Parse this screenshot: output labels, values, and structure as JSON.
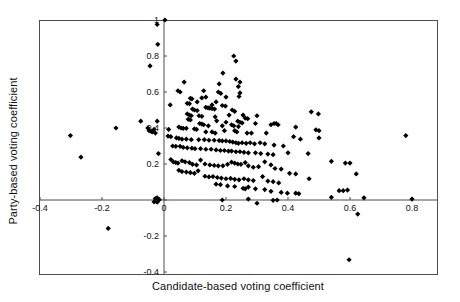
{
  "chart_data": {
    "type": "scatter",
    "title": "",
    "xlabel": "Candidate-based voting coefficient",
    "ylabel": "Party-based voting coefficient",
    "xlim": [
      -0.44,
      0.89
    ],
    "ylim": [
      -0.42,
      1.02
    ],
    "xticks": [
      -0.4,
      -0.2,
      0,
      0.2,
      0.4,
      0.6,
      0.8
    ],
    "xticklabels": [
      "-0.4",
      "-0.2",
      "0",
      "0.2",
      "0.4",
      "0.6",
      "0.8"
    ],
    "yticks": [
      -0.4,
      -0.2,
      0,
      0.2,
      0.4,
      0.6,
      0.8,
      1
    ],
    "yticklabels": [
      "-0.4",
      "-0.2",
      "0",
      "0.2",
      "0.4",
      "0.6",
      "0.8",
      "1"
    ],
    "grid": false,
    "legend": null,
    "marker": "diamond",
    "marker_color": "#000000",
    "marker_size": 4,
    "axis_lines": {
      "x_at_y": 0,
      "y_at_x": 0
    },
    "frame_color": "#4d4d4d",
    "points": [
      [
        0.003,
        1.0
      ],
      [
        -0.022,
        0.975
      ],
      [
        -0.02,
        0.865
      ],
      [
        -0.045,
        0.745
      ],
      [
        0.225,
        0.8
      ],
      [
        0.232,
        0.772
      ],
      [
        0.19,
        0.705
      ],
      [
        0.232,
        0.672
      ],
      [
        0.245,
        0.655
      ],
      [
        0.065,
        0.655
      ],
      [
        0.178,
        0.645
      ],
      [
        0.24,
        0.63
      ],
      [
        0.045,
        0.607
      ],
      [
        0.052,
        0.6
      ],
      [
        0.128,
        0.607
      ],
      [
        0.175,
        0.6
      ],
      [
        0.183,
        0.592
      ],
      [
        0.245,
        0.595
      ],
      [
        0.242,
        0.575
      ],
      [
        0.2,
        0.572
      ],
      [
        0.135,
        0.572
      ],
      [
        0.122,
        0.567
      ],
      [
        0.085,
        0.565
      ],
      [
        0.09,
        0.562
      ],
      [
        0.107,
        0.545
      ],
      [
        0.168,
        0.545
      ],
      [
        0.075,
        0.537
      ],
      [
        0.082,
        0.535
      ],
      [
        0.02,
        0.528
      ],
      [
        0.155,
        0.528
      ],
      [
        0.188,
        0.525
      ],
      [
        0.198,
        0.522
      ],
      [
        0.135,
        0.515
      ],
      [
        0.142,
        0.512
      ],
      [
        0.148,
        0.51
      ],
      [
        0.155,
        0.508
      ],
      [
        0.163,
        0.505
      ],
      [
        0.092,
        0.505
      ],
      [
        0.098,
        0.5
      ],
      [
        0.107,
        0.497
      ],
      [
        0.22,
        0.5
      ],
      [
        0.228,
        0.492
      ],
      [
        0.075,
        0.478
      ],
      [
        0.082,
        0.472
      ],
      [
        0.088,
        0.468
      ],
      [
        0.113,
        0.468
      ],
      [
        0.122,
        0.465
      ],
      [
        0.21,
        0.472
      ],
      [
        0.165,
        0.462
      ],
      [
        0.255,
        0.472
      ],
      [
        0.262,
        0.455
      ],
      [
        0.27,
        0.452
      ],
      [
        0.3,
        0.468
      ],
      [
        0.498,
        0.478
      ],
      [
        0.475,
        0.49
      ],
      [
        0.078,
        0.448
      ],
      [
        0.085,
        0.445
      ],
      [
        0.17,
        0.44
      ],
      [
        0.2,
        0.432
      ],
      [
        0.238,
        0.438
      ],
      [
        0.245,
        0.432
      ],
      [
        0.252,
        0.428
      ],
      [
        0.295,
        0.425
      ],
      [
        0.115,
        0.425
      ],
      [
        0.122,
        0.422
      ],
      [
        0.128,
        0.418
      ],
      [
        0.143,
        0.412
      ],
      [
        0.188,
        0.412
      ],
      [
        0.218,
        0.418
      ],
      [
        0.225,
        0.412
      ],
      [
        0.24,
        0.408
      ],
      [
        0.345,
        0.418
      ],
      [
        0.355,
        0.425
      ],
      [
        0.362,
        0.425
      ],
      [
        0.368,
        0.418
      ],
      [
        0.425,
        0.405
      ],
      [
        0.49,
        0.39
      ],
      [
        0.5,
        0.345
      ],
      [
        0.5,
        0.385
      ],
      [
        0.048,
        0.405
      ],
      [
        0.055,
        0.4
      ],
      [
        0.062,
        0.398
      ],
      [
        0.072,
        0.398
      ],
      [
        0.098,
        0.395
      ],
      [
        0.105,
        0.392
      ],
      [
        0.015,
        0.392
      ],
      [
        0.135,
        0.378
      ],
      [
        0.155,
        0.378
      ],
      [
        0.165,
        0.372
      ],
      [
        0.195,
        0.385
      ],
      [
        0.228,
        0.385
      ],
      [
        0.235,
        0.378
      ],
      [
        0.268,
        0.372
      ],
      [
        0.282,
        0.372
      ],
      [
        0.33,
        0.372
      ],
      [
        0.418,
        0.352
      ],
      [
        0.44,
        0.338
      ],
      [
        0.013,
        0.355
      ],
      [
        0.022,
        0.352
      ],
      [
        0.04,
        0.345
      ],
      [
        0.048,
        0.342
      ],
      [
        0.058,
        0.338
      ],
      [
        0.072,
        0.338
      ],
      [
        0.088,
        0.335
      ],
      [
        0.112,
        0.335
      ],
      [
        0.13,
        0.335
      ],
      [
        0.145,
        0.332
      ],
      [
        0.162,
        0.332
      ],
      [
        0.178,
        0.33
      ],
      [
        0.188,
        0.328
      ],
      [
        0.2,
        0.328
      ],
      [
        0.212,
        0.325
      ],
      [
        0.222,
        0.322
      ],
      [
        0.232,
        0.318
      ],
      [
        0.24,
        0.315
      ],
      [
        0.252,
        0.318
      ],
      [
        0.265,
        0.315
      ],
      [
        0.278,
        0.318
      ],
      [
        0.292,
        0.312
      ],
      [
        0.31,
        0.318
      ],
      [
        0.325,
        0.312
      ],
      [
        0.355,
        0.305
      ],
      [
        0.385,
        0.3
      ],
      [
        0.78,
        0.358
      ],
      [
        -0.302,
        0.358
      ],
      [
        -0.268,
        0.238
      ],
      [
        -0.155,
        0.4
      ],
      [
        -0.075,
        0.438
      ],
      [
        -0.052,
        0.4
      ],
      [
        -0.048,
        0.385
      ],
      [
        -0.042,
        0.382
      ],
      [
        -0.038,
        0.378
      ],
      [
        -0.032,
        0.392
      ],
      [
        -0.028,
        0.372
      ],
      [
        -0.022,
        0.438
      ],
      [
        -0.018,
        0.258
      ],
      [
        0.028,
        0.3
      ],
      [
        0.038,
        0.298
      ],
      [
        0.052,
        0.298
      ],
      [
        0.062,
        0.292
      ],
      [
        0.075,
        0.29
      ],
      [
        0.09,
        0.288
      ],
      [
        0.1,
        0.285
      ],
      [
        0.118,
        0.285
      ],
      [
        0.135,
        0.282
      ],
      [
        0.152,
        0.282
      ],
      [
        0.168,
        0.278
      ],
      [
        0.182,
        0.275
      ],
      [
        0.195,
        0.275
      ],
      [
        0.208,
        0.272
      ],
      [
        0.218,
        0.272
      ],
      [
        0.232,
        0.268
      ],
      [
        0.245,
        0.268
      ],
      [
        0.258,
        0.265
      ],
      [
        0.272,
        0.262
      ],
      [
        0.295,
        0.262
      ],
      [
        0.312,
        0.258
      ],
      [
        0.335,
        0.255
      ],
      [
        0.352,
        0.252
      ],
      [
        0.4,
        0.262
      ],
      [
        0.465,
        0.258
      ],
      [
        0.54,
        0.215
      ],
      [
        0.585,
        0.205
      ],
      [
        0.6,
        0.205
      ],
      [
        0.022,
        0.225
      ],
      [
        0.03,
        0.212
      ],
      [
        0.038,
        0.208
      ],
      [
        0.045,
        0.205
      ],
      [
        0.058,
        0.218
      ],
      [
        0.068,
        0.212
      ],
      [
        0.082,
        0.208
      ],
      [
        0.092,
        0.198
      ],
      [
        0.105,
        0.195
      ],
      [
        0.118,
        0.222
      ],
      [
        0.132,
        0.2
      ],
      [
        0.148,
        0.195
      ],
      [
        0.162,
        0.192
      ],
      [
        0.175,
        0.19
      ],
      [
        0.19,
        0.19
      ],
      [
        0.205,
        0.198
      ],
      [
        0.218,
        0.21
      ],
      [
        0.228,
        0.205
      ],
      [
        0.238,
        0.2
      ],
      [
        0.248,
        0.198
      ],
      [
        0.262,
        0.208
      ],
      [
        0.272,
        0.19
      ],
      [
        0.288,
        0.182
      ],
      [
        0.305,
        0.185
      ],
      [
        0.325,
        0.212
      ],
      [
        0.345,
        0.195
      ],
      [
        0.358,
        0.175
      ],
      [
        0.378,
        0.172
      ],
      [
        0.405,
        0.148
      ],
      [
        0.425,
        0.145
      ],
      [
        0.62,
        0.145
      ],
      [
        0.468,
        0.118
      ],
      [
        0.048,
        0.165
      ],
      [
        0.058,
        0.158
      ],
      [
        0.072,
        0.155
      ],
      [
        0.085,
        0.152
      ],
      [
        0.098,
        0.148
      ],
      [
        0.11,
        0.162
      ],
      [
        0.132,
        0.132
      ],
      [
        0.145,
        0.128
      ],
      [
        0.158,
        0.13
      ],
      [
        0.172,
        0.125
      ],
      [
        0.185,
        0.122
      ],
      [
        0.2,
        0.118
      ],
      [
        0.215,
        0.12
      ],
      [
        0.228,
        0.115
      ],
      [
        0.242,
        0.112
      ],
      [
        0.258,
        0.118
      ],
      [
        0.272,
        0.112
      ],
      [
        0.288,
        0.108
      ],
      [
        0.318,
        0.13
      ],
      [
        0.335,
        0.105
      ],
      [
        0.352,
        0.102
      ],
      [
        0.37,
        0.095
      ],
      [
        0.168,
        0.088
      ],
      [
        0.182,
        0.085
      ],
      [
        0.205,
        0.078
      ],
      [
        0.228,
        0.075
      ],
      [
        0.255,
        0.065
      ],
      [
        0.262,
        0.062
      ],
      [
        0.272,
        0.072
      ],
      [
        0.295,
        0.062
      ],
      [
        0.325,
        0.058
      ],
      [
        0.345,
        0.048
      ],
      [
        0.378,
        0.042
      ],
      [
        0.398,
        0.038
      ],
      [
        0.425,
        0.038
      ],
      [
        0.435,
        0.035
      ],
      [
        0.565,
        0.052
      ],
      [
        0.578,
        0.052
      ],
      [
        0.592,
        0.055
      ],
      [
        0.54,
        0.015
      ],
      [
        0.188,
        0.0
      ],
      [
        0.272,
        0.005
      ],
      [
        0.3,
        -0.018
      ],
      [
        0.352,
        -0.002
      ],
      [
        0.365,
        0.0
      ],
      [
        0.645,
        0.012
      ],
      [
        0.8,
        0.005
      ],
      [
        -0.022,
        0.012
      ],
      [
        -0.028,
        0.008
      ],
      [
        -0.032,
        -0.01
      ],
      [
        -0.022,
        -0.012
      ],
      [
        -0.015,
        0.002
      ],
      [
        0.625,
        -0.078
      ],
      [
        -0.18,
        -0.158
      ],
      [
        0.597,
        -0.332
      ]
    ]
  },
  "axis_label_color": "#101010",
  "tick_label_color": "#101010"
}
